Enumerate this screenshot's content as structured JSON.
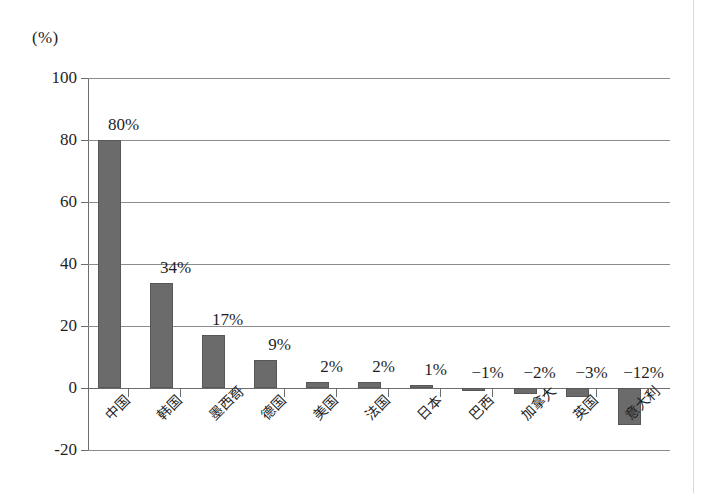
{
  "figure": {
    "unit_label": "(%)",
    "bar_color": "#6b6b6b",
    "grid_color": "#8c8c8c",
    "axis_color": "#6d6d6d",
    "background": "#ffffff"
  },
  "chart_data": {
    "type": "bar",
    "title": "",
    "subtitle": "",
    "xlabel": "",
    "ylabel": "(%)",
    "ylim": [
      -20,
      100
    ],
    "yticks": [
      100,
      80,
      60,
      40,
      20,
      0,
      -20
    ],
    "ytick_labels": [
      "100",
      "80",
      "60",
      "40",
      "20",
      "0",
      "-20"
    ],
    "grid": true,
    "legend": "none",
    "categories": [
      "中国",
      "韩国",
      "墨西哥",
      "德国",
      "美国",
      "法国",
      "日本",
      "巴西",
      "加拿大",
      "英国",
      "意大利"
    ],
    "values": [
      80,
      34,
      17,
      9,
      2,
      2,
      1,
      -1,
      -2,
      -3,
      -12
    ],
    "data_labels": [
      "80%",
      "34%",
      "17%",
      "9%",
      "2%",
      "2%",
      "1%",
      "−1%",
      "−2%",
      "−3%",
      "−12%"
    ]
  }
}
